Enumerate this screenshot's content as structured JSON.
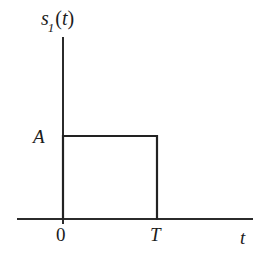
{
  "figure": {
    "background_color": "#ffffff",
    "line_color": "#222222",
    "axis_color": "#2b2b2b"
  },
  "labels": {
    "y_axis_symbol": "s",
    "y_axis_subscript": "1",
    "y_axis_arg_open": "(",
    "y_axis_arg": "t",
    "y_axis_arg_close": ")",
    "y_axis_full": "s1(t)",
    "amplitude": "A",
    "origin": "0",
    "pulse_end": "T",
    "x_axis": "t"
  },
  "chart_data": {
    "type": "line",
    "title": "s1(t)",
    "xlabel": "t",
    "ylabel": "s1(t)",
    "x": [
      0,
      0,
      1,
      1
    ],
    "y": [
      0,
      1,
      1,
      0
    ],
    "series": [
      {
        "name": "s1(t)",
        "points": [
          {
            "x": 0,
            "y": 0
          },
          {
            "x": 0,
            "y": 1
          },
          {
            "x": 1,
            "y": 1
          },
          {
            "x": 1,
            "y": 0
          }
        ]
      }
    ],
    "xtick_labels": [
      "0",
      "T"
    ],
    "xtick_values": [
      0,
      1
    ],
    "ytick_labels": [
      "A"
    ],
    "ytick_values": [
      1
    ],
    "xlim": [
      -0.52,
      2.08
    ],
    "ylim": [
      -0.06,
      1.95
    ],
    "grid": false,
    "legend": false,
    "annotations": [
      {
        "text": "A",
        "x": 0,
        "y": 1,
        "position": "left"
      },
      {
        "text": "T",
        "x": 1,
        "y": 0,
        "position": "below"
      },
      {
        "text": "0",
        "x": 0,
        "y": 0,
        "position": "below"
      }
    ]
  },
  "geometry": {
    "y_axis_x": 63,
    "y_axis_top": 37,
    "y_axis_bottom": 224,
    "x_axis_y": 219,
    "x_axis_left": 17,
    "x_axis_right": 253,
    "pulse_top_y": 136,
    "pulse_end_x": 157
  }
}
